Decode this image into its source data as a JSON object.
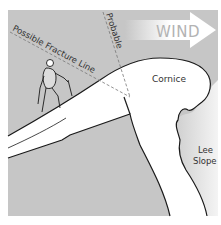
{
  "diagram": {
    "labels": {
      "wind": "WIND",
      "cornice": "Cornice",
      "lee_line1": "Lee",
      "lee_line2": "Slope",
      "possible_fracture": "Possible Fracture Line",
      "probable": "Probable"
    },
    "colors": {
      "background": "#c6c6c6",
      "snow": "#ffffff",
      "outline": "#1a1a1a",
      "dash": "#777777",
      "wind_text": "#b0b0b0"
    }
  }
}
